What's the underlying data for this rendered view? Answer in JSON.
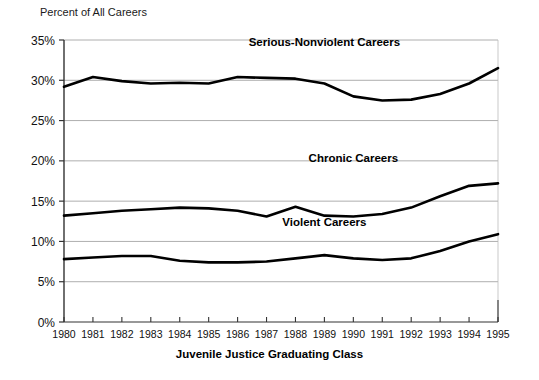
{
  "chart_data": {
    "type": "line",
    "title": "",
    "ylabel": "Percent of All Careers",
    "xlabel": "Juvenile Justice Graduating Class",
    "x": [
      1980,
      1981,
      1982,
      1983,
      1984,
      1985,
      1986,
      1987,
      1988,
      1989,
      1990,
      1991,
      1992,
      1993,
      1994,
      1995
    ],
    "categories": [
      "1980",
      "1981",
      "1982",
      "1983",
      "1984",
      "1985",
      "1986",
      "1987",
      "1988",
      "1989",
      "1990",
      "1991",
      "1992",
      "1993",
      "1994",
      "1995"
    ],
    "ylim": [
      0,
      35
    ],
    "xlim": [
      1980,
      1995
    ],
    "yticks": [
      0,
      5,
      10,
      15,
      20,
      25,
      30,
      35
    ],
    "ytick_labels": [
      "0%",
      "5%",
      "10%",
      "15%",
      "20%",
      "25%",
      "30%",
      "35%"
    ],
    "grid": true,
    "legend_position": "inline-annotations",
    "series": [
      {
        "name": "Serious-Nonviolent Careers",
        "color": "#000000",
        "label_x": 1989,
        "label_y": 34.2,
        "values": [
          29.2,
          30.4,
          29.9,
          29.6,
          29.7,
          29.6,
          30.4,
          30.3,
          30.2,
          29.6,
          28.0,
          27.5,
          27.6,
          28.3,
          29.6,
          31.5
        ]
      },
      {
        "name": "Chronic Careers",
        "color": "#000000",
        "label_x": 1990,
        "label_y": 19.9,
        "values": [
          13.2,
          13.5,
          13.8,
          14.0,
          14.2,
          14.1,
          13.8,
          13.1,
          14.3,
          13.2,
          13.1,
          13.4,
          14.2,
          15.6,
          16.9,
          17.2
        ]
      },
      {
        "name": "Violent Careers",
        "color": "#000000",
        "label_x": 1989,
        "label_y": 11.9,
        "values": [
          7.8,
          8.0,
          8.2,
          8.2,
          7.6,
          7.4,
          7.4,
          7.5,
          7.9,
          8.3,
          7.9,
          7.7,
          7.9,
          8.8,
          10.0,
          10.9
        ]
      }
    ],
    "series_ordered_values": {
      "serious_nonviolent": [
        29.2,
        30.4,
        29.9,
        29.6,
        29.7,
        29.6,
        30.4,
        30.3,
        30.2,
        29.6,
        28.0,
        27.5,
        27.6,
        28.3,
        29.6,
        31.5
      ],
      "chronic": [
        13.2,
        13.5,
        13.8,
        14.0,
        14.2,
        14.1,
        13.8,
        13.1,
        14.3,
        13.2,
        13.1,
        13.4,
        14.2,
        15.6,
        16.9,
        17.2
      ],
      "violent": [
        7.8,
        8.0,
        8.2,
        8.2,
        7.6,
        7.4,
        7.4,
        7.5,
        7.9,
        8.3,
        7.9,
        7.7,
        7.9,
        8.8,
        10.0,
        10.9
      ]
    }
  }
}
